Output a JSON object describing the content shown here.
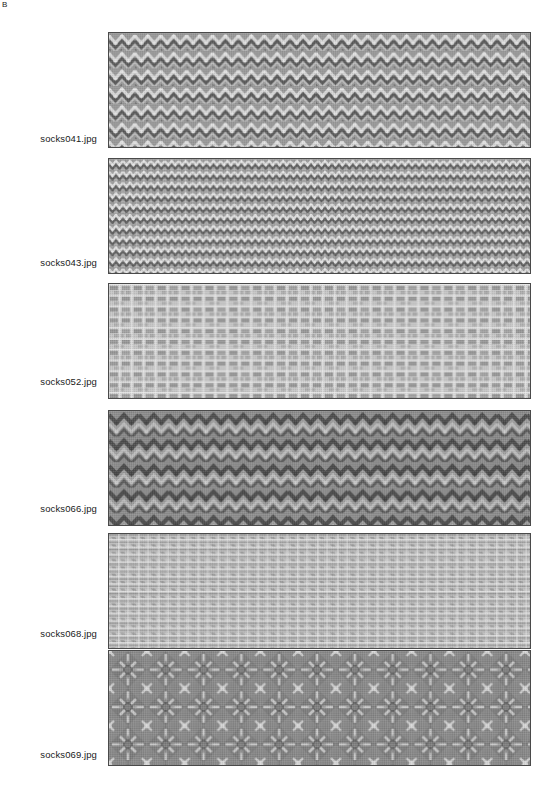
{
  "figure": {
    "panel_letter": "B",
    "background_color": "#ffffff",
    "swatch_border_color": "#4a4a4a",
    "rows": [
      {
        "label": "socks041.jpg",
        "pattern": "chevron-zigzag-knit",
        "base_color": "#9a9a9a",
        "light_color": "#d6d6d6",
        "dark_color": "#5c5c5c",
        "mean_gray": 153
      },
      {
        "label": "socks043.jpg",
        "pattern": "fine-diagonal-rib-knit",
        "base_color": "#9d9d9d",
        "light_color": "#dcdcdc",
        "dark_color": "#5f5f5f",
        "mean_gray": 157
      },
      {
        "label": "socks052.jpg",
        "pattern": "light-blocky-houndstooth-knit",
        "base_color": "#c2c2c2",
        "light_color": "#ececec",
        "dark_color": "#8e8e8e",
        "mean_gray": 194
      },
      {
        "label": "socks066.jpg",
        "pattern": "dark-zigzag-diamond-knit",
        "base_color": "#8b8b8b",
        "light_color": "#c8c8c8",
        "dark_color": "#4f4f4f",
        "mean_gray": 139
      },
      {
        "label": "socks068.jpg",
        "pattern": "light-banded-crosshatch-knit",
        "base_color": "#bdbdbd",
        "light_color": "#e8e8e8",
        "dark_color": "#868686",
        "mean_gray": 189
      },
      {
        "label": "socks069.jpg",
        "pattern": "dark-star-diamond-jacquard-knit",
        "base_color": "#888888",
        "light_color": "#cfcfcf",
        "dark_color": "#4a4a4a",
        "mean_gray": 136
      }
    ]
  }
}
